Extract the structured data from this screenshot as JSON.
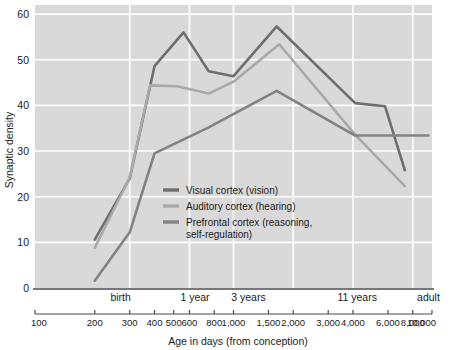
{
  "chart_data": {
    "type": "line",
    "title": "",
    "xlabel": "Age in days (from conception)",
    "ylabel": "Synaptic density",
    "xscale": "log",
    "xlim": [
      100,
      10000
    ],
    "ylim": [
      0,
      62
    ],
    "grid": true,
    "legend_position": "center",
    "yticks": [
      0,
      10,
      20,
      30,
      40,
      50,
      60
    ],
    "ytick_labels": [
      "0",
      "10",
      "20",
      "30",
      "40",
      "50",
      "60"
    ],
    "xticks": [
      100,
      200,
      300,
      400,
      500,
      600,
      800,
      1000,
      1500,
      2000,
      3000,
      4000,
      6000,
      8000,
      10000
    ],
    "xtick_labels": [
      "100",
      "200",
      "300",
      "400",
      "500",
      "600",
      "800",
      "1,000",
      "1,500",
      "2,000",
      "3,000",
      "4,000",
      "6,000",
      "8,000",
      "10,000"
    ],
    "age_markers": [
      {
        "label": "birth",
        "days": 270
      },
      {
        "label": "1 year",
        "days": 640
      },
      {
        "label": "3 years",
        "days": 1190
      },
      {
        "label": "11 years",
        "days": 4200
      },
      {
        "label": "adult",
        "days": 9600
      }
    ],
    "series": [
      {
        "name": "Visual cortex (vision)",
        "color": "#6e6e6e",
        "x": [
          200,
          300,
          400,
          560,
          750,
          1000,
          1650,
          4100,
          5800,
          7300
        ],
        "y": [
          10.6,
          24.0,
          48.6,
          56.0,
          47.5,
          46.4,
          57.3,
          40.5,
          39.8,
          25.8
        ]
      },
      {
        "name": "Auditory cortex (hearing)",
        "color": "#a9a9a9",
        "x": [
          200,
          300,
          380,
          520,
          750,
          1000,
          1700,
          4100,
          7300
        ],
        "y": [
          8.8,
          24.2,
          44.4,
          44.2,
          42.6,
          45.2,
          53.4,
          33.6,
          22.3
        ]
      },
      {
        "name": "Prefrontal cortex (reasoning, self-regulation)",
        "color": "#828282",
        "x": [
          200,
          300,
          400,
          750,
          1650,
          4100,
          6000,
          9600
        ],
        "y": [
          1.6,
          12.2,
          29.5,
          35.2,
          43.2,
          33.4,
          33.4,
          33.4
        ]
      }
    ]
  },
  "legend": {
    "items": [
      {
        "label": "Visual cortex (vision)",
        "color": "#6e6e6e"
      },
      {
        "label": "Auditory cortex (hearing)",
        "color": "#a9a9a9"
      },
      {
        "label": "Prefrontal cortex (reasoning,",
        "label2": "self-regulation)",
        "color": "#828282"
      }
    ]
  },
  "style": {
    "plot_bg": "#d9d9d9",
    "grid_color": "#ffffff",
    "axis_color": "#4a4a4a",
    "text_color": "#1a1a1a"
  }
}
